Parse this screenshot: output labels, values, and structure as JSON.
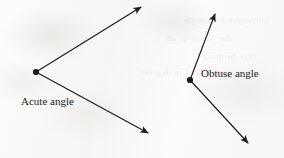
{
  "figure": {
    "background_color": "#fbfbfa",
    "ink_color": "#1d1c1b",
    "bleed_through_lines": [
      "corresponding angle",
      "the vertex of an",
      "rays forming",
      "measured in degrees"
    ]
  },
  "diagram_data": {
    "type": "geometry",
    "unit": "px",
    "canvas": {
      "width": 284,
      "height": 158
    },
    "shapes": [
      {
        "id": "acute-angle",
        "kind": "angle",
        "label": "Acute angle",
        "label_position": {
          "x": 21,
          "y": 95
        },
        "vertex": {
          "x": 36,
          "y": 72
        },
        "vertex_dot_radius": 3.1,
        "opening_direction": "right",
        "rays": [
          {
            "id": "acute-upper-ray",
            "from": {
              "x": 36,
              "y": 72
            },
            "to": {
              "x": 141,
              "y": 7
            },
            "arrowhead": "end"
          },
          {
            "id": "acute-lower-ray",
            "from": {
              "x": 36,
              "y": 72
            },
            "to": {
              "x": 148,
              "y": 133
            },
            "arrowhead": "end"
          }
        ]
      },
      {
        "id": "obtuse-angle",
        "kind": "angle",
        "label": "Obtuse angle",
        "label_position": {
          "x": 201,
          "y": 67
        },
        "vertex": {
          "x": 190,
          "y": 80
        },
        "vertex_dot_radius": 3.1,
        "opening_direction": "right",
        "rays": [
          {
            "id": "obtuse-upper-ray",
            "from": {
              "x": 190,
              "y": 80
            },
            "to": {
              "x": 215,
              "y": 14
            },
            "arrowhead": "end"
          },
          {
            "id": "obtuse-lower-ray",
            "from": {
              "x": 190,
              "y": 80
            },
            "to": {
              "x": 248,
              "y": 143
            },
            "arrowhead": "end"
          }
        ]
      }
    ],
    "labels": [
      {
        "id": "acute-angle-label",
        "text": "Acute angle"
      },
      {
        "id": "obtuse-angle-label",
        "text": "Obtuse angle"
      }
    ]
  },
  "labels": {
    "acute": "Acute angle",
    "obtuse": "Obtuse angle"
  }
}
